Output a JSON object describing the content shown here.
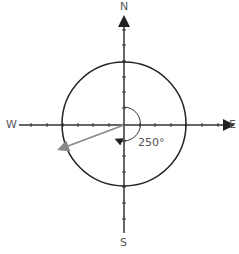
{
  "diagram": {
    "directions": {
      "north": "N",
      "east": "E",
      "south": "S",
      "west": "W"
    },
    "angle_label": "250°",
    "bearing_degrees": 250,
    "colors": {
      "axis": "#333333",
      "circle": "#222222",
      "vector": "#888888",
      "text": "#555555"
    }
  }
}
